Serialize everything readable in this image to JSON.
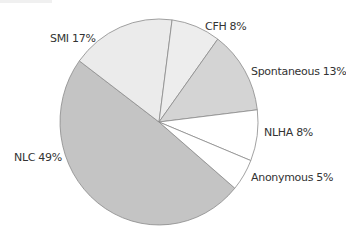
{
  "chart_data": {
    "type": "pie",
    "title": "",
    "start_angle_deg": 40,
    "direction": "clockwise",
    "slices": [
      {
        "label": "NLC",
        "value": 49,
        "display": "NLC 49%",
        "color": "#c4c4c4"
      },
      {
        "label": "SMI",
        "value": 17,
        "display": "SMI 17%",
        "color": "#ebebeb"
      },
      {
        "label": "CFH",
        "value": 8,
        "display": "CFH 8%",
        "color": "#ededed"
      },
      {
        "label": "Spontaneous",
        "value": 13,
        "display": "Spontaneous 13%",
        "color": "#d4d4d4"
      },
      {
        "label": "NLHA",
        "value": 8,
        "display": "NLHA 8%",
        "color": "#ffffff"
      },
      {
        "label": "Anonymous",
        "value": 5,
        "display": "Anonymous 5%",
        "color": "#ffffff"
      }
    ],
    "edge_color": "#8a8a8a",
    "legend": "none"
  }
}
